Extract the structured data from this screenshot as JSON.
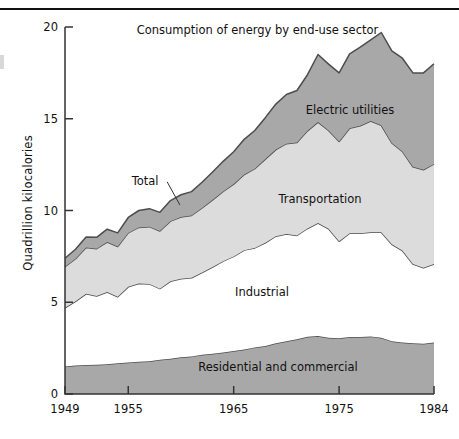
{
  "figure": {
    "title": "Consumption of energy by end-use sector",
    "ylabel": "Quadrillion kilocalories",
    "total_annotation": "Total"
  },
  "colors": {
    "electric_utilities": "#a8a8a8",
    "transportation": "#dcdcdc",
    "industrial": "#ffffff",
    "residential_and_commercial": "#a8a8a8",
    "outline": "#4d4d4d",
    "axis": "#333333",
    "text": "#111111",
    "background": "#ffffff"
  },
  "chart_data": {
    "type": "area",
    "title": "Consumption of energy by end-use sector",
    "xlabel": "",
    "ylabel": "Quadrillion kilocalories",
    "stacked": true,
    "grid": false,
    "legend_position": "inline-labels",
    "xlim": [
      1949,
      1984
    ],
    "ylim": [
      0,
      20
    ],
    "yticks": [
      0,
      5,
      10,
      15,
      20
    ],
    "xticks": [
      1949,
      1955,
      1965,
      1975,
      1984
    ],
    "xtick_labels": [
      "1949",
      "1955",
      "1965",
      "1975",
      "1984"
    ],
    "ytick_labels": [
      "0",
      "5",
      "10",
      "15",
      "20"
    ],
    "annotations": [
      {
        "text": "Total",
        "x": 1956.6,
        "y": 11.4,
        "leader_to": {
          "x": 1959.9,
          "y": 10.3
        }
      }
    ],
    "x": [
      1949,
      1950,
      1951,
      1952,
      1953,
      1954,
      1955,
      1956,
      1957,
      1958,
      1959,
      1960,
      1961,
      1962,
      1963,
      1964,
      1965,
      1966,
      1967,
      1968,
      1969,
      1970,
      1971,
      1972,
      1973,
      1974,
      1975,
      1976,
      1977,
      1978,
      1979,
      1980,
      1981,
      1982,
      1983,
      1984
    ],
    "series": [
      {
        "name": "Residential and commercial",
        "label": "Residential and commercial",
        "color": "#a8a8a8",
        "values": [
          1.5,
          1.55,
          1.58,
          1.6,
          1.62,
          1.68,
          1.72,
          1.76,
          1.78,
          1.86,
          1.92,
          2.0,
          2.05,
          2.14,
          2.2,
          2.26,
          2.34,
          2.42,
          2.54,
          2.62,
          2.76,
          2.88,
          2.98,
          3.12,
          3.16,
          3.06,
          3.04,
          3.1,
          3.1,
          3.14,
          3.06,
          2.88,
          2.8,
          2.76,
          2.74,
          2.8
        ]
      },
      {
        "name": "Industrial",
        "label": "Industrial",
        "color": "#ffffff",
        "values": [
          3.2,
          3.5,
          3.88,
          3.74,
          3.94,
          3.62,
          4.12,
          4.26,
          4.22,
          3.88,
          4.22,
          4.28,
          4.28,
          4.48,
          4.72,
          4.98,
          5.16,
          5.42,
          5.42,
          5.62,
          5.84,
          5.84,
          5.66,
          5.9,
          6.16,
          5.94,
          5.28,
          5.66,
          5.66,
          5.68,
          5.76,
          5.28,
          5.02,
          4.32,
          4.14,
          4.28
        ]
      },
      {
        "name": "Transportation",
        "label": "Transportation",
        "color": "#dcdcdc",
        "values": [
          2.24,
          2.32,
          2.52,
          2.58,
          2.72,
          2.74,
          2.94,
          3.06,
          3.12,
          3.14,
          3.28,
          3.36,
          3.4,
          3.52,
          3.66,
          3.8,
          3.94,
          4.12,
          4.32,
          4.56,
          4.72,
          4.92,
          5.06,
          5.32,
          5.5,
          5.36,
          5.44,
          5.72,
          5.86,
          6.06,
          5.82,
          5.52,
          5.4,
          5.3,
          5.34,
          5.46
        ]
      },
      {
        "name": "Electric utilities",
        "label": "Electric utilities",
        "color": "#a8a8a8",
        "values": [
          0.46,
          0.52,
          0.58,
          0.62,
          0.7,
          0.74,
          0.84,
          0.92,
          0.98,
          1.02,
          1.12,
          1.22,
          1.3,
          1.4,
          1.52,
          1.64,
          1.76,
          1.92,
          2.08,
          2.26,
          2.48,
          2.68,
          2.84,
          3.06,
          3.68,
          3.62,
          3.74,
          4.06,
          4.28,
          4.42,
          5.06,
          5.02,
          5.08,
          5.12,
          5.28,
          5.46
        ]
      }
    ],
    "totals": [
      7.4,
      7.89,
      8.56,
      8.54,
      8.98,
      8.78,
      9.62,
      10.0,
      10.1,
      9.9,
      10.54,
      10.86,
      11.03,
      11.54,
      12.1,
      12.68,
      13.2,
      13.88,
      14.36,
      15.06,
      15.8,
      16.32,
      16.54,
      17.4,
      18.5,
      17.98,
      17.5,
      18.54,
      18.9,
      19.3,
      19.7,
      18.7,
      18.3,
      17.5,
      17.5,
      18.0
    ]
  }
}
